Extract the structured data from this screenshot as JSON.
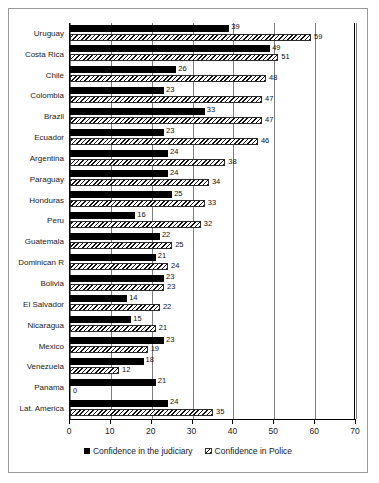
{
  "chart_data": {
    "type": "bar",
    "orientation": "horizontal",
    "title": "",
    "xlabel": "",
    "ylabel": "",
    "xlim": [
      0,
      70
    ],
    "xticks": [
      0,
      10,
      20,
      30,
      40,
      50,
      60,
      70
    ],
    "grid": true,
    "legend_position": "bottom",
    "categories": [
      "Uruguay",
      "Costa Rica",
      "Chile",
      "Colombia",
      "Brazil",
      "Ecuador",
      "Argentina",
      "Paraguay",
      "Honduras",
      "Peru",
      "Guatemala",
      "Dominican R",
      "Bolivia",
      "El Salvador",
      "Nicaragua",
      "Mexico",
      "Venezuela",
      "Panama",
      "Lat. America"
    ],
    "series": [
      {
        "name": "Confidence in the judiciary",
        "style": "solid-black",
        "values": [
          39,
          49,
          26,
          23,
          33,
          23,
          24,
          24,
          25,
          16,
          22,
          21,
          23,
          14,
          15,
          23,
          18,
          21,
          24
        ]
      },
      {
        "name": "Confidence in Police",
        "style": "hatched",
        "values": [
          59,
          51,
          48,
          47,
          47,
          46,
          38,
          34,
          33,
          32,
          25,
          24,
          23,
          22,
          21,
          19,
          12,
          0,
          35
        ]
      }
    ]
  },
  "legend": {
    "items": [
      {
        "label": "Confidence in the judiciary",
        "swatch": "solid-square-icon"
      },
      {
        "label": "Confidence in Police",
        "swatch": "hatched-square-icon"
      }
    ]
  }
}
